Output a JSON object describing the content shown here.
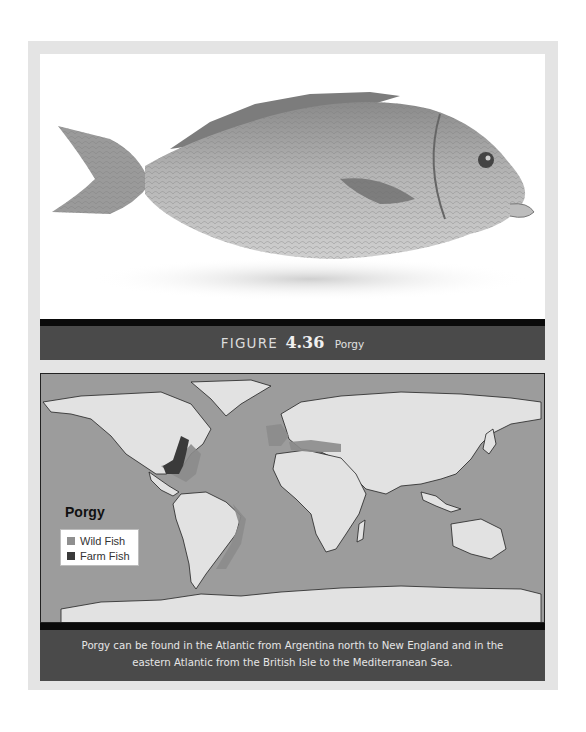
{
  "figure": {
    "label": "FIGURE",
    "number": "4.36",
    "name": "Porgy",
    "photo_subject": "porgy-fish-photo"
  },
  "map": {
    "legend": {
      "title": "Porgy",
      "items": [
        {
          "label": "Wild Fish",
          "color": "#8f8f8f"
        },
        {
          "label": "Farm Fish",
          "color": "#3a3a3a"
        }
      ]
    },
    "colors": {
      "ocean": "#9c9c9c",
      "land": "#e2e2e2",
      "wild": "#8c8c8c",
      "farm": "#3a3a3a"
    }
  },
  "caption": {
    "line1": "Porgy can be found in the Atlantic from Argentina north to New England and in the",
    "line2": "eastern Atlantic from the British Isle to the Mediterranean Sea."
  }
}
